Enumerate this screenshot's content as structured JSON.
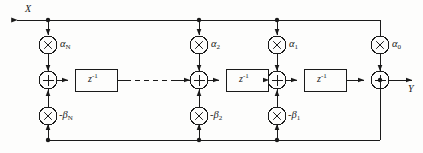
{
  "diagram": {
    "type": "signal-flow-graph",
    "stroke_color": "#1a1a1a",
    "background_color": "#fdfdfc"
  },
  "io": {
    "input_label": "X",
    "output_label": "Y"
  },
  "operators": {
    "multiply_glyph": "×",
    "add_glyph": "+"
  },
  "delay_blocks": [
    {
      "id": "z1",
      "label_base": "z",
      "label_exp": "-1"
    },
    {
      "id": "z2",
      "label_base": "z",
      "label_exp": "-1"
    },
    {
      "id": "z3",
      "label_base": "z",
      "label_exp": "-1"
    }
  ],
  "feedforward_coefficients": [
    {
      "id": "aN",
      "base": "α",
      "sub": "N"
    },
    {
      "id": "a2",
      "base": "α",
      "sub": "2"
    },
    {
      "id": "a1",
      "base": "α",
      "sub": "1"
    },
    {
      "id": "a0",
      "base": "α",
      "sub": "0"
    }
  ],
  "feedback_coefficients": [
    {
      "id": "bN",
      "sign": "-",
      "base": "β",
      "sub": "N"
    },
    {
      "id": "b2",
      "sign": "-",
      "base": "β",
      "sub": "2"
    },
    {
      "id": "b1",
      "sign": "-",
      "base": "β",
      "sub": "1"
    }
  ],
  "adders": [
    {
      "id": "sum_N"
    },
    {
      "id": "sum_2"
    },
    {
      "id": "sum_1"
    },
    {
      "id": "sum_0"
    }
  ],
  "ellipsis": {
    "style": "dashed",
    "meaning": "repeated stages omitted"
  }
}
